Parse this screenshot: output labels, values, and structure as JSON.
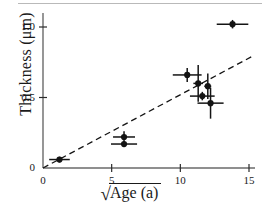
{
  "figure": {
    "background": "#ffffff",
    "ink_color": "#141414",
    "scanline_color": "#b9b9b9"
  },
  "axes": {
    "x_tick_labels": [
      "0",
      "5",
      "10",
      "15"
    ],
    "y_tick_labels": [
      "0",
      "0.5",
      "1.0"
    ],
    "x_label_radical": "√",
    "x_label_radicand": "Age (a)",
    "y_label": "Thickness (μm)"
  },
  "chart_data": {
    "type": "scatter",
    "title": "",
    "xlabel": "sqrt(Age (a))",
    "ylabel": "Thickness (μm)",
    "xlim": [
      0,
      15.5
    ],
    "ylim": [
      0,
      1.12
    ],
    "xticks": [
      0,
      5,
      10,
      15
    ],
    "yticks": [
      0,
      0.5,
      1.0
    ],
    "grid": false,
    "legend": "none",
    "marker": "filled-circle",
    "error_bars": "x and y",
    "points": [
      {
        "x": 1.2,
        "y": 0.06,
        "xerr": 0.75,
        "yerr": 0.02
      },
      {
        "x": 5.9,
        "y": 0.22,
        "xerr": 0.8,
        "yerr": 0.04
      },
      {
        "x": 5.9,
        "y": 0.17,
        "xerr": 0.95,
        "yerr": 0.02
      },
      {
        "x": 10.5,
        "y": 0.66,
        "xerr": 1.05,
        "yerr": 0.05
      },
      {
        "x": 11.3,
        "y": 0.6,
        "xerr": 0.35,
        "yerr": 0.13
      },
      {
        "x": 12.0,
        "y": 0.58,
        "xerr": 0.25,
        "yerr": 0.09
      },
      {
        "x": 11.6,
        "y": 0.51,
        "xerr": 0.9,
        "yerr": 0.03
      },
      {
        "x": 12.2,
        "y": 0.46,
        "xerr": 0.95,
        "yerr": 0.11
      },
      {
        "x": 13.8,
        "y": 1.02,
        "xerr": 1.15,
        "yerr": 0.03
      }
    ],
    "trend_line": {
      "style": "dashed",
      "x_start": 0.0,
      "y_start": 0.0,
      "x_end": 15.2,
      "y_end": 0.79
    }
  }
}
